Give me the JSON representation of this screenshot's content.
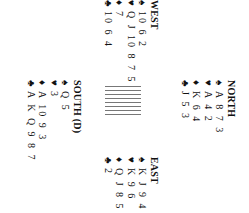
{
  "diagram": {
    "dealer": "South",
    "hands": {
      "north": {
        "title": "NORTH",
        "spades": "A 8 7 3",
        "hearts": "A 4 2",
        "diamonds": "K 6 4",
        "clubs": "J 5 3"
      },
      "west": {
        "title": "WEST",
        "spades": "10 6 2",
        "hearts": "Q J 10 8 7 5",
        "diamonds": "7",
        "clubs": "10 6 4"
      },
      "east": {
        "title": "EAST",
        "spades": "K J 9 4",
        "hearts": "K 9 6",
        "diamonds": "Q J 8 5 2",
        "clubs": "2"
      },
      "south": {
        "title": "SOUTH (D)",
        "spades": "Q 5",
        "hearts": "3",
        "diamonds": "A 10 9 3",
        "clubs": "A K Q 9 8 7"
      }
    },
    "suit_symbols": {
      "spades": "♠",
      "hearts": "♥",
      "diamonds": "♦",
      "clubs": "♣"
    },
    "rotation": "90deg clockwise"
  }
}
